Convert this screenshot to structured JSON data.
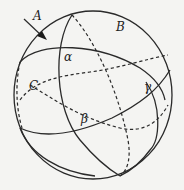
{
  "figure": {
    "labels": {
      "A": "A",
      "B": "B",
      "C": "C",
      "alpha": "α",
      "beta": "β",
      "gamma": "γ"
    },
    "colors": {
      "background": "#f4f4f2",
      "stroke": "#2a2a2a"
    }
  }
}
